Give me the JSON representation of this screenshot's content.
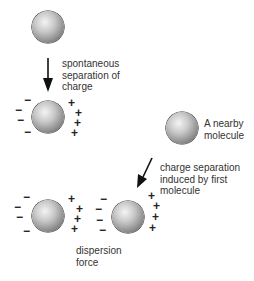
{
  "diagram": {
    "title": "",
    "labels": {
      "spontaneous": "spontaneous\nseparation of\ncharge",
      "nearby": "A nearby\nmolecule",
      "induced": "charge separation\ninduced by first\nmolecule",
      "dispersion": "dispersion\nforce"
    },
    "signs": {
      "minus": "−",
      "plus": "+"
    },
    "molecules": [
      {
        "id": "top",
        "state": "neutral"
      },
      {
        "id": "polarized-first",
        "state": "instantaneous dipole"
      },
      {
        "id": "nearby",
        "state": "neutral"
      },
      {
        "id": "bottom-left",
        "state": "dipole"
      },
      {
        "id": "bottom-right",
        "state": "induced dipole"
      }
    ],
    "colors": {
      "sphere_light": "#f4f4f4",
      "sphere_dark": "#3a3a3a",
      "text": "#333333",
      "arrow": "#111111"
    }
  }
}
